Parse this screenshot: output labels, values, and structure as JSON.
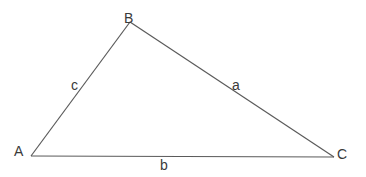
{
  "diagram": {
    "type": "triangle",
    "line_color": "#5a5a5a",
    "text_color": "#3a3a3a",
    "vertices": [
      {
        "name": "A",
        "x": 31,
        "y": 156
      },
      {
        "name": "B",
        "x": 130,
        "y": 22
      },
      {
        "name": "C",
        "x": 334,
        "y": 157
      }
    ],
    "vertex_labels": {
      "A": "A",
      "B": "B",
      "C": "C"
    },
    "sides": [
      {
        "name": "a",
        "from": "B",
        "to": "C",
        "label": "a"
      },
      {
        "name": "b",
        "from": "A",
        "to": "C",
        "label": "b"
      },
      {
        "name": "c",
        "from": "A",
        "to": "B",
        "label": "c"
      }
    ]
  }
}
